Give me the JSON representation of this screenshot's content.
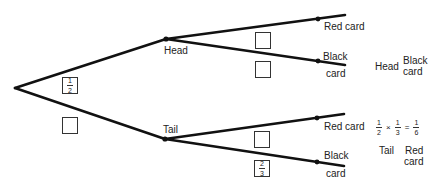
{
  "diagram": {
    "type": "probability-tree",
    "nodes": {
      "first_level": [
        {
          "label": "Head"
        },
        {
          "label": "Tail"
        }
      ],
      "second_level": {
        "head": [
          {
            "label": "Red card"
          },
          {
            "label_line1": "Black",
            "label_line2": "card"
          }
        ],
        "tail": [
          {
            "label": "Red card"
          },
          {
            "label_line1": "Black",
            "label_line2": "card"
          }
        ]
      }
    },
    "probability_boxes": {
      "head_branch": {
        "numerator": "1",
        "denominator": "2"
      },
      "tail_branch": {
        "value": ""
      },
      "head_red": {
        "value": ""
      },
      "head_black": {
        "value": ""
      },
      "tail_red": {
        "value": ""
      },
      "tail_black": {
        "numerator": "2",
        "denominator": "3"
      }
    },
    "outcomes": {
      "head_black": {
        "line1": "Head",
        "line2a": "Black",
        "line2b": "card"
      },
      "tail_red": {
        "formula": {
          "a_num": "1",
          "a_den": "2",
          "times": "×",
          "b_num": "1",
          "b_den": "3",
          "equals": "=",
          "c_num": "1",
          "c_den": "6"
        },
        "word1": "Tail",
        "word2a": "Red",
        "word2b": "card"
      }
    }
  }
}
